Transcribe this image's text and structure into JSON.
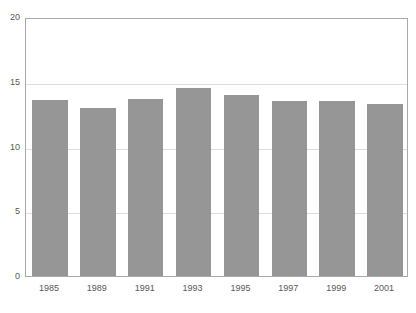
{
  "chart_data": {
    "type": "bar",
    "title": "",
    "subtitle": "",
    "xlabel": "",
    "ylabel": "",
    "categories": [
      "1985",
      "1989",
      "1991",
      "1993",
      "1995",
      "1997",
      "1999",
      "2001"
    ],
    "values": [
      13.6,
      13.0,
      13.7,
      14.5,
      14.0,
      13.5,
      13.5,
      13.3
    ],
    "series": [
      {
        "name": "",
        "values": [
          13.6,
          13.0,
          13.7,
          14.5,
          14.0,
          13.5,
          13.5,
          13.3
        ]
      }
    ],
    "ylim": [
      0,
      20
    ],
    "yticks": [
      0,
      5,
      10,
      15,
      20
    ],
    "ytick_labels": [
      "0",
      "5",
      "10",
      "15",
      "20"
    ],
    "xtick_labels": [
      "1985",
      "1989",
      "1991",
      "1993",
      "1995",
      "1997",
      "1999",
      "2001"
    ],
    "grid": true,
    "grid_axis": "y",
    "legend": false,
    "legend_position": "none",
    "bar_color": "#969696",
    "grid_color": "#dededf",
    "axis_color": "#a9a9ac",
    "text_color": "#58585a",
    "background": "#ffffff",
    "annotations": []
  },
  "top_text_fragment": ""
}
